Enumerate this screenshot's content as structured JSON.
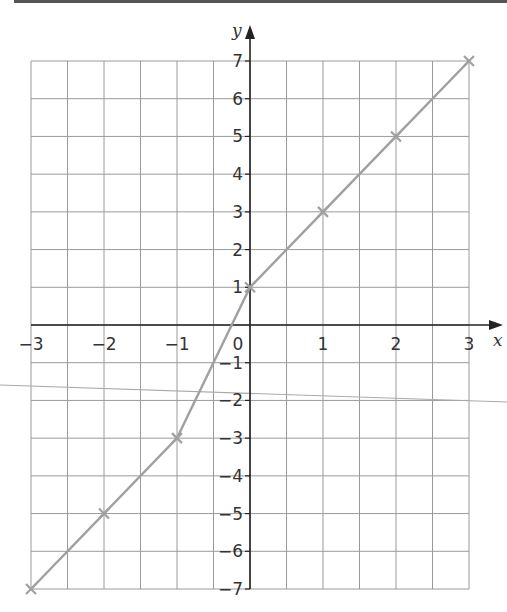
{
  "chart_data": {
    "type": "line",
    "title": "",
    "xlabel": "x",
    "ylabel": "y",
    "xlim": [
      -3,
      3
    ],
    "ylim": [
      -7,
      7
    ],
    "grid": true,
    "grid_step": 0.5,
    "x_ticks": [
      "-3",
      "-2",
      "-1",
      "0",
      "1",
      "2",
      "3"
    ],
    "y_ticks": [
      "7",
      "6",
      "5",
      "4",
      "3",
      "2",
      "1",
      "-1",
      "-2",
      "-3",
      "-4",
      "-5",
      "-6",
      "-7"
    ],
    "origin_label": "0",
    "series": [
      {
        "name": "graph",
        "color": "#a0a0a0",
        "x": [
          -3,
          -2,
          -1,
          0,
          1,
          2,
          3
        ],
        "y": [
          -7,
          -5,
          -3,
          1,
          3,
          5,
          7
        ],
        "markers": "cross"
      }
    ],
    "annotations": [
      {
        "type": "stray-line",
        "from": [
          0,
          385
        ],
        "to": [
          507,
          402
        ],
        "color": "#aaaaaa"
      }
    ]
  }
}
